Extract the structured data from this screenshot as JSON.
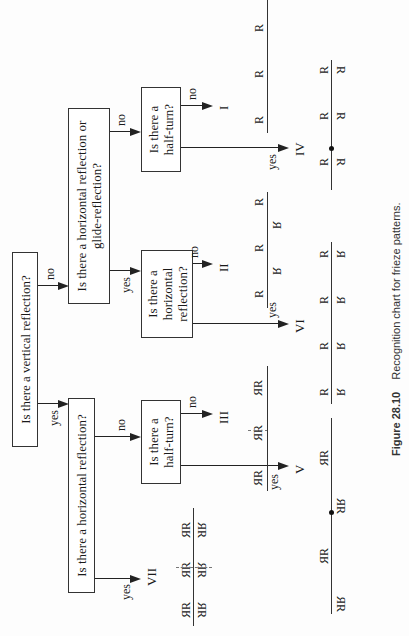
{
  "questions": {
    "root": "Is there a vertical reflection?",
    "left_q": "Is there a horizontal reflection?",
    "right_q": "Is there a horizontal reflection or glide-reflection?",
    "left_halfturn": "Is there a half-turn?",
    "mid_horizontal": "Is there a horizontal reflection?",
    "right_halfturn": "Is there a half-turn?"
  },
  "edge_labels": {
    "yes": "yes",
    "no": "no"
  },
  "patterns": {
    "I": "I",
    "II": "II",
    "III": "III",
    "IV": "IV",
    "V": "V",
    "VI": "VI",
    "VII": "VII"
  },
  "glyph": "R",
  "caption": {
    "figure": "Figure 28.10",
    "text": "Recognition chart for frieze patterns."
  }
}
